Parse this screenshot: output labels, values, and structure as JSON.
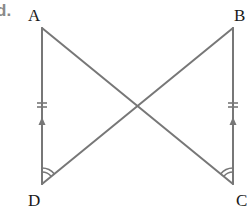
{
  "part_label": "d.",
  "vertices": {
    "A": {
      "label": "A",
      "x": 42,
      "y": 28
    },
    "B": {
      "label": "B",
      "x": 233,
      "y": 28
    },
    "C": {
      "label": "C",
      "x": 233,
      "y": 184
    },
    "D": {
      "label": "D",
      "x": 42,
      "y": 184
    }
  },
  "segments": [
    "AD",
    "BC",
    "AC",
    "BD"
  ],
  "markings": {
    "AD": [
      "double-tick (equal length)",
      "arrow (parallel)"
    ],
    "BC": [
      "double-tick (equal length)",
      "arrow (parallel)"
    ],
    "angle_D": "double-arc (equal angle ADB)",
    "angle_C": "double-arc (equal angle BCA)"
  },
  "colors": {
    "line": "#777777",
    "label": "#1a1a1a",
    "part_label": "#8a8a8a"
  }
}
